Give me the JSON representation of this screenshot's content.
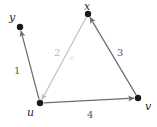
{
  "figure": {
    "type": "directed-graph-diagram",
    "width": 157,
    "height": 127,
    "background": "#ffffff"
  },
  "colors": {
    "node_fill": "#1a1a1a",
    "edge_dark": "#6e6e6e",
    "edge_light": "#c2c2c2",
    "label_dark": "#585858",
    "label_light": "#b9b9b9",
    "label_faint": "#dcdcdc",
    "node_label": "#2b2b2b"
  },
  "nodes": [
    {
      "id": "y",
      "label": "y",
      "x": 20,
      "y": 27,
      "label_x": 9,
      "label_y": 12,
      "r": 3.2
    },
    {
      "id": "x",
      "label": "x",
      "x": 88,
      "y": 14,
      "label_x": 84,
      "label_y": 1,
      "r": 3.2
    },
    {
      "id": "u",
      "label": "u",
      "x": 40,
      "y": 103,
      "label_x": 27,
      "label_y": 107,
      "r": 3.2
    },
    {
      "id": "v",
      "label": "v",
      "x": 138,
      "y": 98,
      "label_x": 145,
      "label_y": 101,
      "r": 3.2
    }
  ],
  "edges": [
    {
      "id": "edge-1",
      "from": "u",
      "to": "y",
      "label": "1",
      "label_x": 14,
      "label_y": 66,
      "label_style": "dark",
      "color": "#6e6e6e",
      "arrow": "to"
    },
    {
      "id": "edge-2",
      "from": "x",
      "to": "u",
      "label": "2",
      "label_x": 54,
      "label_y": 48,
      "label_style": "light",
      "color": "#c2c2c2",
      "arrow": "to",
      "extra_label": "e",
      "extra_label_x": 70,
      "extra_label_y": 55
    },
    {
      "id": "edge-3",
      "from": "v",
      "to": "x",
      "label": "3",
      "label_x": 117,
      "label_y": 48,
      "label_style": "dark",
      "color": "#6e6e6e",
      "arrow": "to"
    },
    {
      "id": "edge-4",
      "from": "u",
      "to": "v",
      "label": "4",
      "label_x": 87,
      "label_y": 110,
      "label_style": "dark",
      "color": "#6e6e6e",
      "arrow": "to"
    }
  ]
}
